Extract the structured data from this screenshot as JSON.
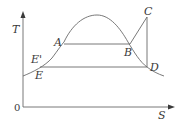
{
  "diagram": {
    "type": "temperature-entropy (T-S) diagram",
    "axes": {
      "y_label": "T",
      "x_label": "S",
      "origin_label": "0"
    },
    "points": {
      "A": "A",
      "B": "B",
      "C": "C",
      "D": "D",
      "E": "E",
      "E_prime": "E'"
    },
    "colors": {
      "line": "#6a6a6a",
      "text": "#3a3a3a",
      "background": "#ffffff"
    }
  }
}
